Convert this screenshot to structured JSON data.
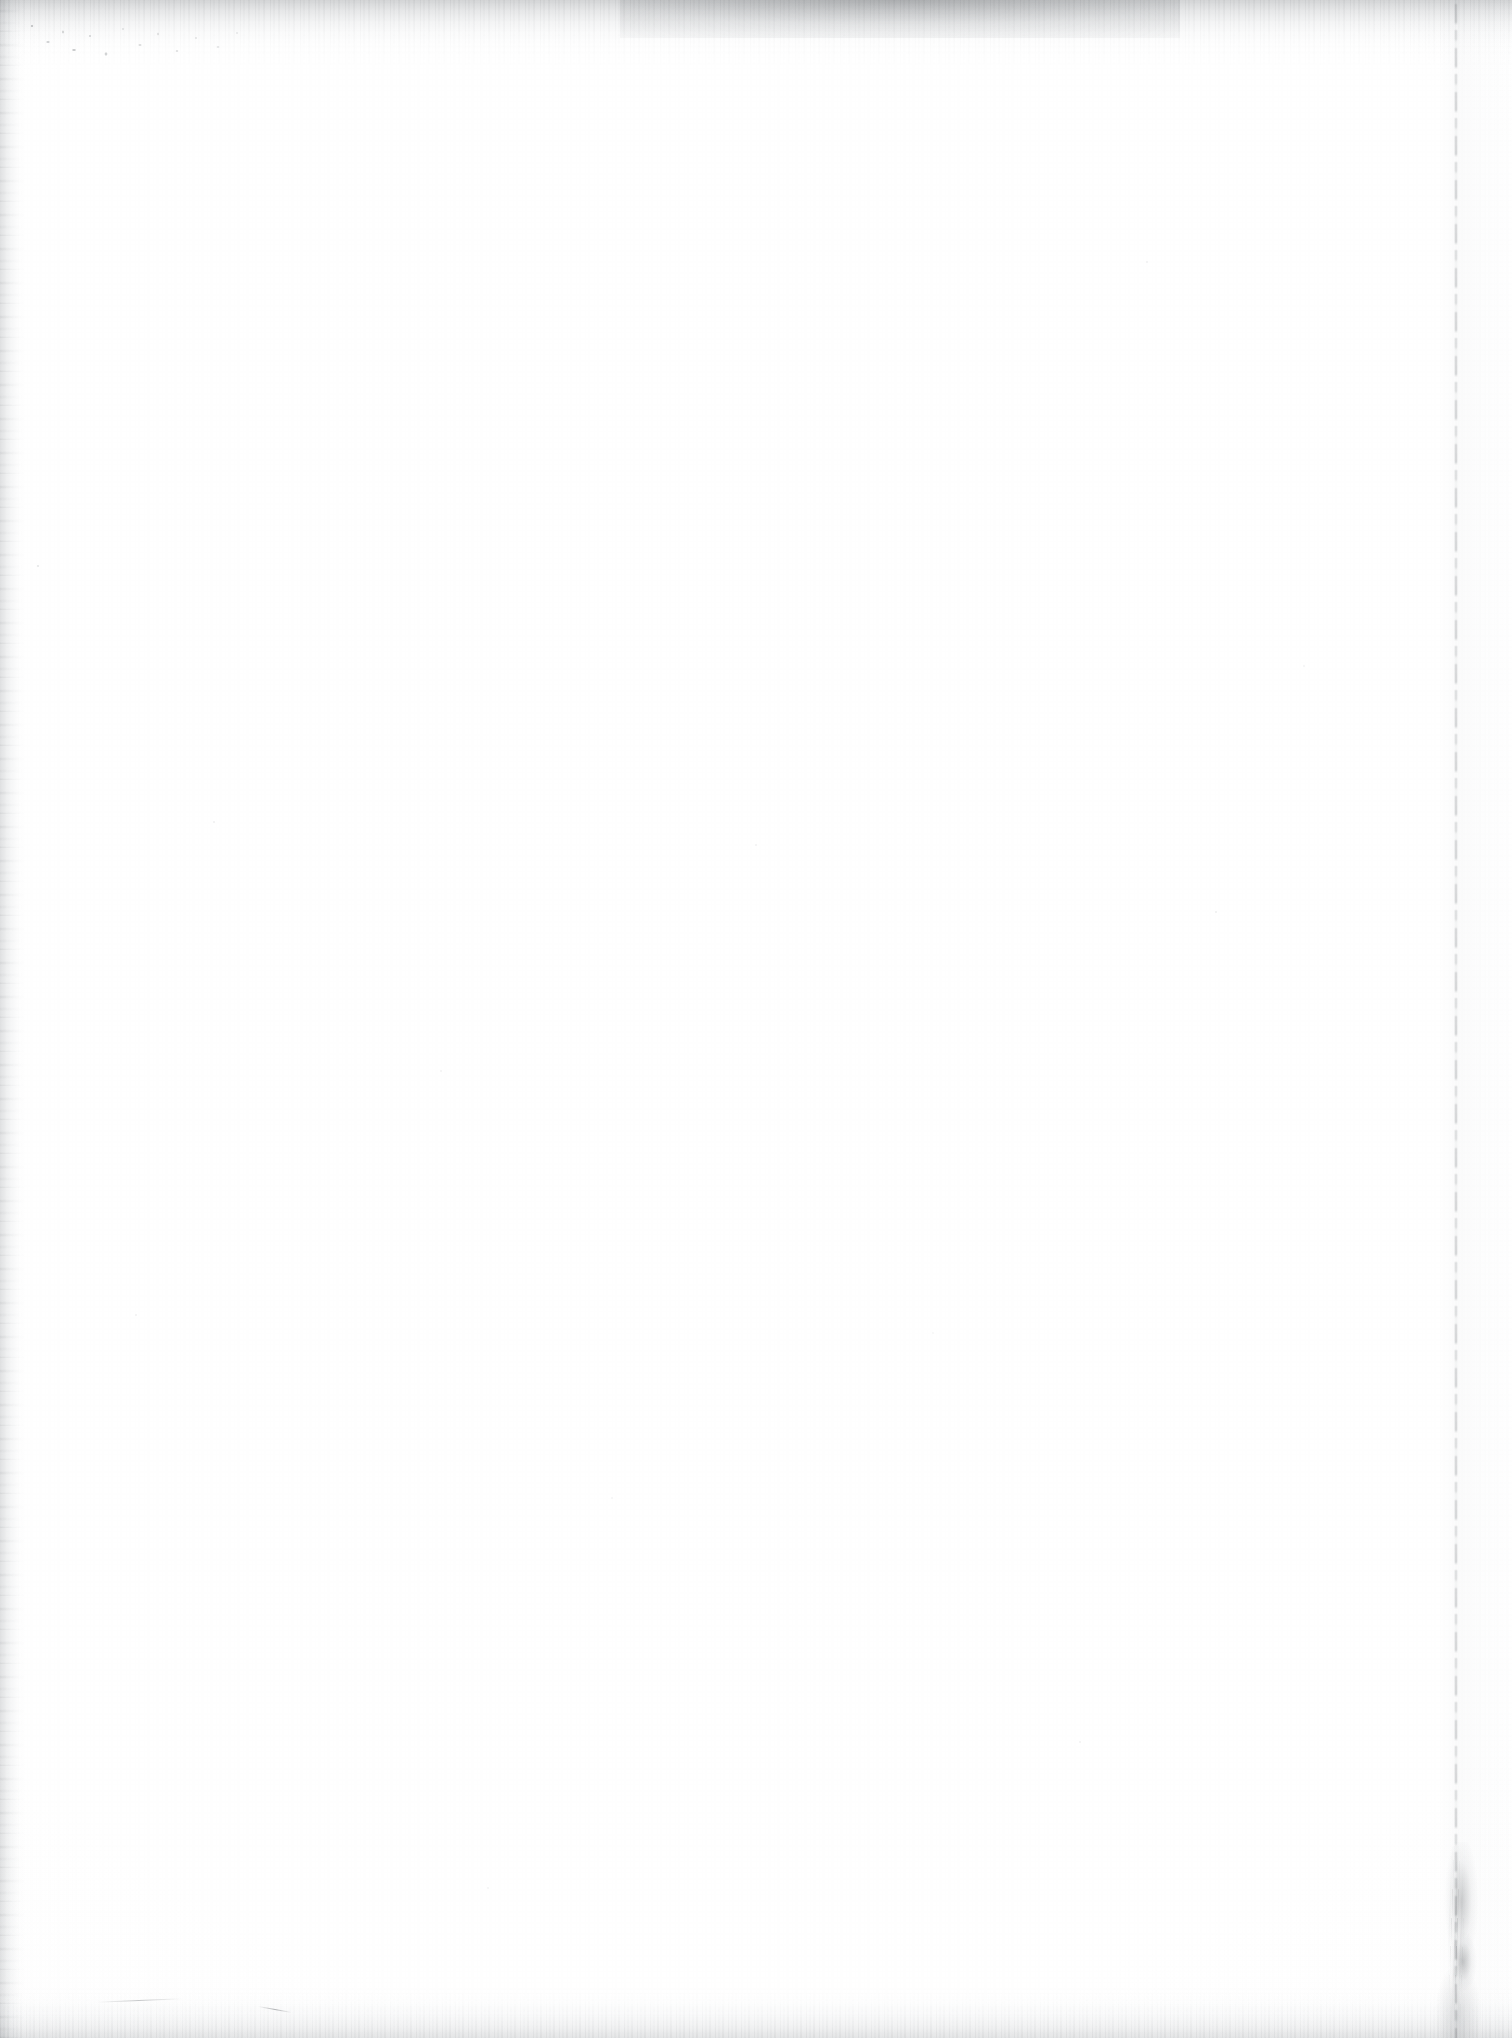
{
  "page": {
    "kind": "scanned-blank-page",
    "width_px": 1512,
    "height_px": 2038,
    "text_content": "",
    "page_number": "",
    "header": "",
    "footer": ""
  },
  "colors": {
    "paper": "#ffffff",
    "paper_shade": "#fbfbfb",
    "edge_shadow": "#9aa0a4",
    "edge_shadow_dark": "#5c6064",
    "speck": "#5a5e62"
  },
  "artifacts": {
    "top_edge_band": {
      "name": "top-edge-shadow",
      "height_px": 56,
      "note": "grey gradient band with fine vertical scan streaks, darkest between x 620 and 1180"
    },
    "bottom_edge_band": {
      "name": "bottom-edge-shadow",
      "height_px": 52,
      "note": "lighter ragged grey band with comb-like vertical streaks"
    },
    "left_edge_band": {
      "name": "left-edge-shadow",
      "width_px": 26,
      "note": "vertical grey shadow running the full page height"
    },
    "right_page_edge_line": {
      "name": "page-edge-rule",
      "x_px": 1455,
      "note": "thin broken dotted vertical page-edge line spanning the full height, strongest near the bottom"
    },
    "bottom_right_crease": {
      "name": "fold-crease",
      "x_px": 1424,
      "y_px": 1842,
      "width_px": 78,
      "height_px": 196,
      "note": "darker smudge and fold crease at the lower right page corner"
    },
    "top_left_speckles": {
      "name": "dust-speckle-cluster",
      "x_px": 22,
      "y_px": 14,
      "width_px": 230,
      "height_px": 62,
      "note": "dense cluster of dust and toner specks along the upper left edge"
    },
    "dust_field": {
      "name": "scattered-dust",
      "note": "isolated faint dust specks distributed sparsely across the otherwise blank sheet"
    }
  }
}
